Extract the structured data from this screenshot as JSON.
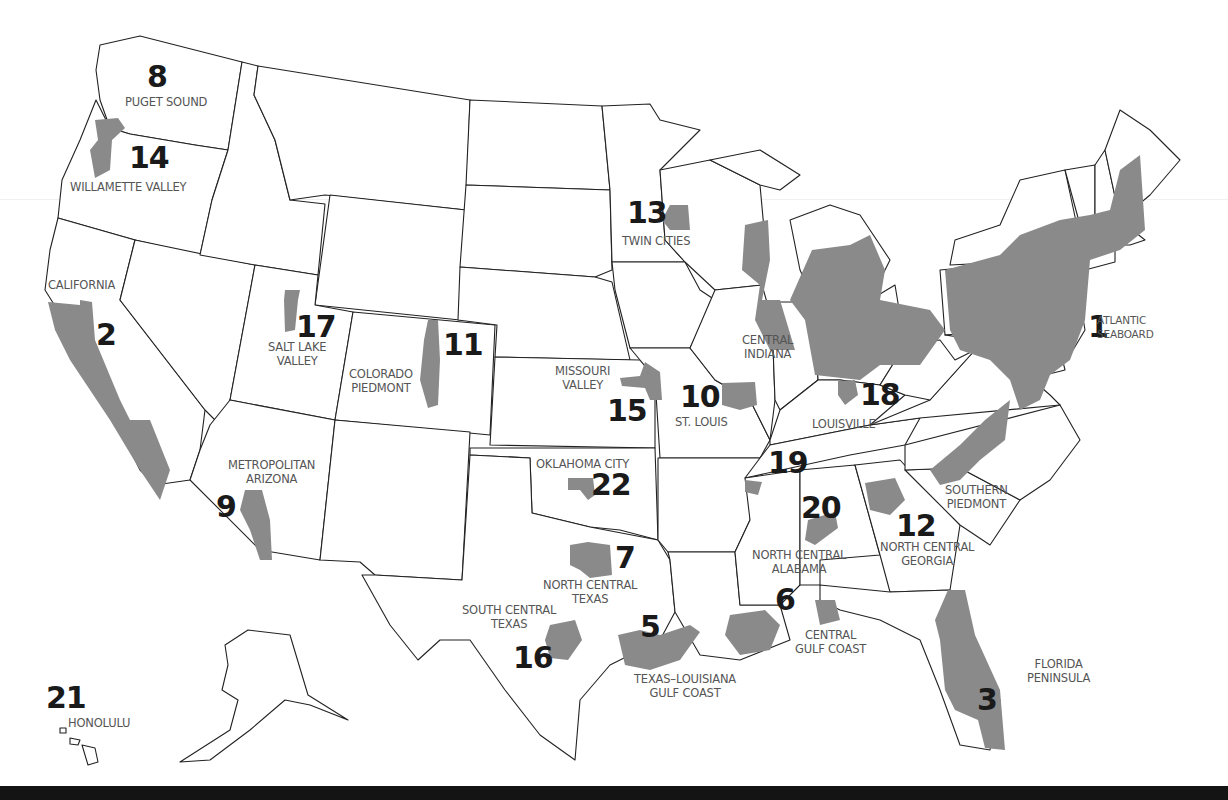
{
  "map": {
    "title": "Regions",
    "colors": {
      "region_fill": "#8a8a8a",
      "state_stroke": "#222222",
      "background": "#ffffff",
      "footer": "#141414"
    }
  },
  "regions": [
    {
      "number": "1",
      "name": "ATLANTIC SEABOARD"
    },
    {
      "number": "2",
      "name": "CALIFORNIA"
    },
    {
      "number": "3",
      "name": "FLORIDA PENINSULA"
    },
    {
      "number": "5",
      "name": "TEXAS–LOUISIANA GULF COAST"
    },
    {
      "number": "6",
      "name": "CENTRAL GULF COAST"
    },
    {
      "number": "7",
      "name": "NORTH CENTRAL TEXAS"
    },
    {
      "number": "8",
      "name": "PUGET SOUND"
    },
    {
      "number": "9",
      "name": "METROPOLITAN ARIZONA"
    },
    {
      "number": "10",
      "name": "ST. LOUIS"
    },
    {
      "number": "11",
      "name": "COLORADO PIEDMONT"
    },
    {
      "number": "12",
      "name": "NORTH CENTRAL GEORGIA"
    },
    {
      "number": "13",
      "name": "TWIN CITIES"
    },
    {
      "number": "14",
      "name": "WILLAMETTE VALLEY"
    },
    {
      "number": "15",
      "name": "MISSOURI VALLEY"
    },
    {
      "number": "16",
      "name": "SOUTH CENTRAL TEXAS"
    },
    {
      "number": "17",
      "name": "SALT LAKE VALLEY"
    },
    {
      "number": "18",
      "name": "LOUISVILLE"
    },
    {
      "number": "19",
      "name": ""
    },
    {
      "number": "20",
      "name": "NORTH CENTRAL ALABAMA"
    },
    {
      "number": "21",
      "name": "HONOLULU"
    },
    {
      "number": "22",
      "name": "OKLAHOMA CITY"
    }
  ],
  "labels": {
    "atlantic_1": "ATLANTIC",
    "atlantic_2": "SEABOARD",
    "california": "CALIFORNIA",
    "florida_1": "FLORIDA",
    "florida_2": "PENINSULA",
    "txla_1": "TEXAS–LOUISIANA",
    "txla_2": "GULF COAST",
    "cgc_1": "CENTRAL",
    "cgc_2": "GULF COAST",
    "nct_1": "NORTH CENTRAL",
    "nct_2": "TEXAS",
    "puget": "PUGET SOUND",
    "az_1": "METROPOLITAN",
    "az_2": "ARIZONA",
    "stlouis": "ST. LOUIS",
    "co_1": "COLORADO",
    "co_2": "PIEDMONT",
    "ncg_1": "NORTH CENTRAL",
    "ncg_2": "GEORGIA",
    "twin": "TWIN CITIES",
    "willamette": "WILLAMETTE VALLEY",
    "mo_1": "MISSOURI",
    "mo_2": "VALLEY",
    "sct_1": "SOUTH CENTRAL",
    "sct_2": "TEXAS",
    "slc_1": "SALT LAKE",
    "slc_2": "VALLEY",
    "louisville": "LOUISVILLE",
    "nca_1": "NORTH CENTRAL",
    "nca_2": "ALABAMA",
    "honolulu": "HONOLULU",
    "okc": "OKLAHOMA CITY",
    "central_indiana_1": "CENTRAL",
    "central_indiana_2": "INDIANA",
    "southern_piedmont_1": "SOUTHERN",
    "southern_piedmont_2": "PIEDMONT"
  },
  "numbers": {
    "n1": "1",
    "n2": "2",
    "n3": "3",
    "n5": "5",
    "n6": "6",
    "n7": "7",
    "n8": "8",
    "n9": "9",
    "n10": "10",
    "n11": "11",
    "n12": "12",
    "n13": "13",
    "n14": "14",
    "n15": "15",
    "n16": "16",
    "n17": "17",
    "n18": "18",
    "n19": "19",
    "n20": "20",
    "n21": "21",
    "n22": "22"
  }
}
